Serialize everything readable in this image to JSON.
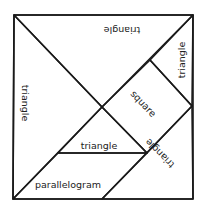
{
  "diagram": {
    "type": "tangram",
    "outline": "square",
    "pieces": [
      {
        "id": "top-large-triangle",
        "label": "triangle",
        "points": [
          [
            14,
            15
          ],
          [
            193,
            15
          ],
          [
            102,
            107
          ]
        ]
      },
      {
        "id": "left-large-triangle",
        "label": "triangle",
        "points": [
          [
            14,
            15
          ],
          [
            102,
            107
          ],
          [
            13,
            199
          ]
        ]
      },
      {
        "id": "top-right-small-triangle",
        "label": "triangle",
        "points": [
          [
            193,
            15
          ],
          [
            150,
            60
          ],
          [
            192,
            106
          ]
        ]
      },
      {
        "id": "square",
        "label": "square",
        "points": [
          [
            150,
            60
          ],
          [
            192,
            106
          ],
          [
            147,
            153
          ],
          [
            102,
            107
          ]
        ]
      },
      {
        "id": "center-small-triangle",
        "label": "triangle",
        "points": [
          [
            102,
            107
          ],
          [
            147,
            153
          ],
          [
            58,
            153
          ]
        ]
      },
      {
        "id": "parallelogram",
        "label": "parallelogram",
        "points": [
          [
            13,
            199
          ],
          [
            58,
            153
          ],
          [
            147,
            153
          ],
          [
            102,
            199
          ]
        ]
      },
      {
        "id": "bottom-right-medium-triangle",
        "label": "triangle",
        "points": [
          [
            192,
            106
          ],
          [
            193,
            199
          ],
          [
            102,
            199
          ]
        ]
      }
    ]
  },
  "labels": {
    "top_triangle": "triangle",
    "left_triangle": "triangle",
    "top_right_triangle": "triangle",
    "square": "square",
    "center_triangle": "triangle",
    "parallelogram": "parallelogram",
    "bottom_right_triangle": "triangle"
  },
  "colors": {
    "line": "#1a1a1a",
    "text": "#222222",
    "background": "#ffffff"
  }
}
